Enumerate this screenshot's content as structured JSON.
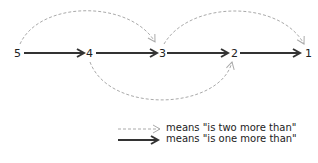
{
  "diagram": {
    "nodes": [
      {
        "label": "5",
        "x": 20,
        "y": 53
      },
      {
        "label": "4",
        "x": 89,
        "y": 53
      },
      {
        "label": "3",
        "x": 162,
        "y": 53
      },
      {
        "label": "2",
        "x": 234,
        "y": 53
      },
      {
        "label": "1",
        "x": 307,
        "y": 53
      }
    ],
    "solid_arrows": [
      {
        "from": "5",
        "to": "4"
      },
      {
        "from": "4",
        "to": "3"
      },
      {
        "from": "3",
        "to": "2"
      },
      {
        "from": "2",
        "to": "1"
      }
    ],
    "dashed_arrows": [
      {
        "from": "5",
        "to": "3",
        "direction": "above"
      },
      {
        "from": "3",
        "to": "1",
        "direction": "above"
      },
      {
        "from": "4",
        "to": "2",
        "direction": "below"
      }
    ],
    "colors": {
      "solid": "#333333",
      "dashed": "#aaaaaa"
    }
  },
  "legend": {
    "items": [
      {
        "style": "dashed",
        "text": "means  \"is two more than\""
      },
      {
        "style": "solid",
        "text": "means  \"is one more than\""
      }
    ]
  }
}
